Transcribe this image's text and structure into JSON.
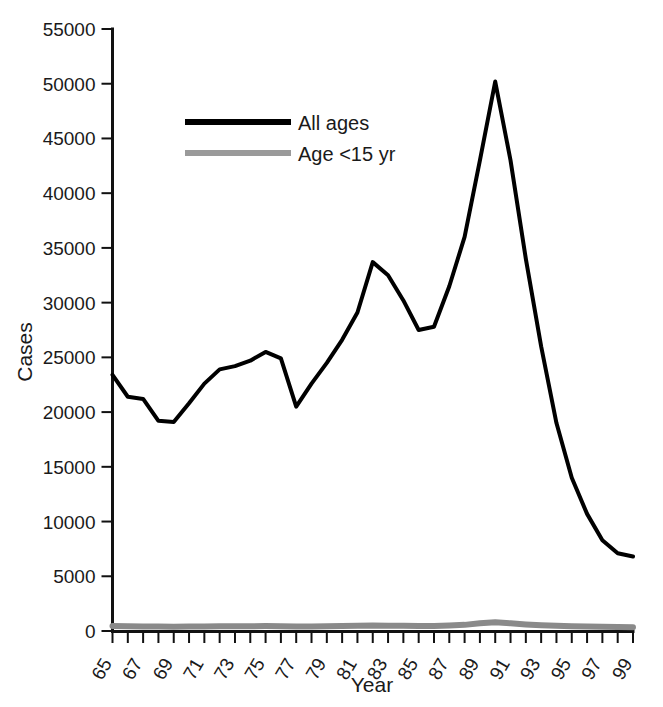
{
  "chart_data": {
    "type": "line",
    "title": "",
    "xlabel": "Year",
    "ylabel": "Cases",
    "xlim": [
      65,
      99
    ],
    "ylim": [
      0,
      55000
    ],
    "grid": false,
    "legend_position": "upper-left-inside",
    "y_ticks": [
      0,
      5000,
      10000,
      15000,
      20000,
      25000,
      30000,
      35000,
      40000,
      45000,
      50000,
      55000
    ],
    "y_tick_labels": [
      "0",
      "5000",
      "10000",
      "15000",
      "20000",
      "25000",
      "30000",
      "35000",
      "40000",
      "45000",
      "50000",
      "55000"
    ],
    "x_ticks": [
      65,
      66,
      67,
      68,
      69,
      70,
      71,
      72,
      73,
      74,
      75,
      76,
      77,
      78,
      79,
      80,
      81,
      82,
      83,
      84,
      85,
      86,
      87,
      88,
      89,
      90,
      91,
      92,
      93,
      94,
      95,
      96,
      97,
      98,
      99
    ],
    "x_tick_labels": [
      "65",
      "",
      "67",
      "",
      "69",
      "",
      "71",
      "",
      "73",
      "",
      "75",
      "",
      "77",
      "",
      "79",
      "",
      "81",
      "",
      "83",
      "",
      "85",
      "",
      "87",
      "",
      "89",
      "",
      "91",
      "",
      "93",
      "",
      "95",
      "",
      "97",
      "",
      "99"
    ],
    "x": [
      65,
      66,
      67,
      68,
      69,
      70,
      71,
      72,
      73,
      74,
      75,
      76,
      77,
      78,
      79,
      80,
      81,
      82,
      83,
      84,
      85,
      86,
      87,
      88,
      89,
      90,
      91,
      92,
      93,
      94,
      95,
      96,
      97,
      98,
      99
    ],
    "series": [
      {
        "name": "All ages",
        "color": "#000000",
        "width": 4,
        "values": [
          23400,
          21400,
          21200,
          19200,
          19100,
          20800,
          22600,
          23900,
          24200,
          24700,
          25500,
          24900,
          20500,
          22600,
          24500,
          26600,
          29100,
          33700,
          32500,
          30200,
          27500,
          27800,
          31500,
          36000,
          43000,
          50200,
          43000,
          34000,
          26000,
          19000,
          14000,
          10700,
          8300,
          7100,
          6800
        ]
      },
      {
        "name": "Age <15 yr",
        "color": "#8a8a8a",
        "width": 6,
        "values": [
          450,
          430,
          420,
          400,
          390,
          400,
          420,
          430,
          430,
          440,
          450,
          440,
          400,
          420,
          440,
          460,
          470,
          500,
          490,
          470,
          450,
          460,
          500,
          560,
          700,
          800,
          700,
          600,
          520,
          470,
          430,
          400,
          380,
          360,
          350
        ]
      }
    ],
    "legend_entries": [
      {
        "label": "All ages",
        "color": "#000000",
        "width": 6
      },
      {
        "label": "Age <15 yr",
        "color": "#9a9a9a",
        "width": 6
      }
    ]
  }
}
